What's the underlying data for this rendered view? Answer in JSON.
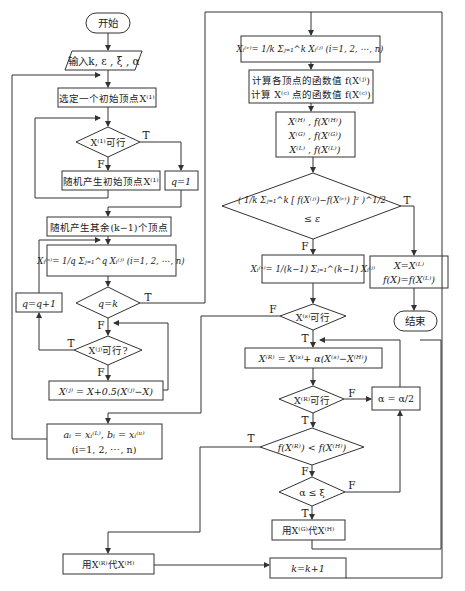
{
  "nodes": {
    "start": "开始",
    "input": "输入k, ε , ξ , α",
    "select_initial": "选定一个初始顶点X⁽¹⁾",
    "x1_feasible": "X⁽¹⁾可行",
    "random_initial": "随机产生初始顶点X⁽¹⁾",
    "q_init": "q=1",
    "random_rest": "随机产生其余(k−1)个顶点",
    "centroid_q": "Xᵢ⁽ˢ⁾= 1/q Σⱼ₌₁^q Xᵢ⁽ʲ⁾ (i=1, 2, ⋯, n)",
    "q_eq_k": "q=k",
    "q_inc": "q=q+1",
    "xj_feasible": "X⁽ʲ⁾可行?",
    "xj_update": "X⁽ʲ⁾ = X+0.5(X⁽ʲ⁾−X)",
    "bounds_line1": "aᵢ = xᵢ⁽ᴸ⁾, bᵢ = xᵢ⁽ᵘ⁾",
    "bounds_line2": "(i=1, 2, ⋯, n)",
    "replace_h_with_r": "用X⁽ᴿ⁾代X⁽ᴴ⁾",
    "centroid_k": "Xᵢ⁽ᶜ⁾= 1/k Σⱼ₌₁^k Xᵢ⁽ʲ⁾ (i=1, 2, ⋯, n)",
    "compute_line1": "计算各顶点的函数值 f(X⁽ʲ⁾)",
    "compute_line2": "计算 X⁽ᶜ⁾ 点的函数值 f(X⁽ᶜ⁾)",
    "hgl_line1": "X⁽ᴴ⁾ , f(X⁽ᴴ⁾)",
    "hgl_line2": "X⁽ᴳ⁾ , f(X⁽ᴳ⁾)",
    "hgl_line3": "X⁽ᴸ⁾ , f(X⁽ᴸ⁾)",
    "converge_line1": "( 1/k Σⱼ₌₁^k [ f(X⁽ʲ⁾)−f(X⁽ᶜ⁾) ]² )^1/2",
    "converge_line2": "≤ ε",
    "centroid_s": "Xᵢ⁽ˢ⁾= 1/(k−1) Σⱼ₌₁^(k−1) Xᵢ⁽ʲ⁾",
    "result_line1": "X=X⁽ᴸ⁾",
    "result_line2": "f(X)=f(X⁽ᴸ⁾)",
    "end": "结束",
    "xs_feasible": "X⁽ˢ⁾可行",
    "reflect": "X⁽ᴿ⁾ = X⁽ˢ⁾+ α(X⁽ˢ⁾−X⁽ᴴ⁾)",
    "xr_feasible": "X⁽ᴿ⁾可行",
    "halve_alpha": "α = α/2",
    "fr_lt_fh": "f(X⁽ᴿ⁾) < f(X⁽ᴴ⁾)",
    "alpha_le_xi": "α ≤ ξ",
    "replace_h_with_g": "用X⁽ᴳ⁾代X⁽ᴴ⁾",
    "k_inc": "k=k+1"
  },
  "branch_labels": {
    "true": "T",
    "false": "F"
  }
}
